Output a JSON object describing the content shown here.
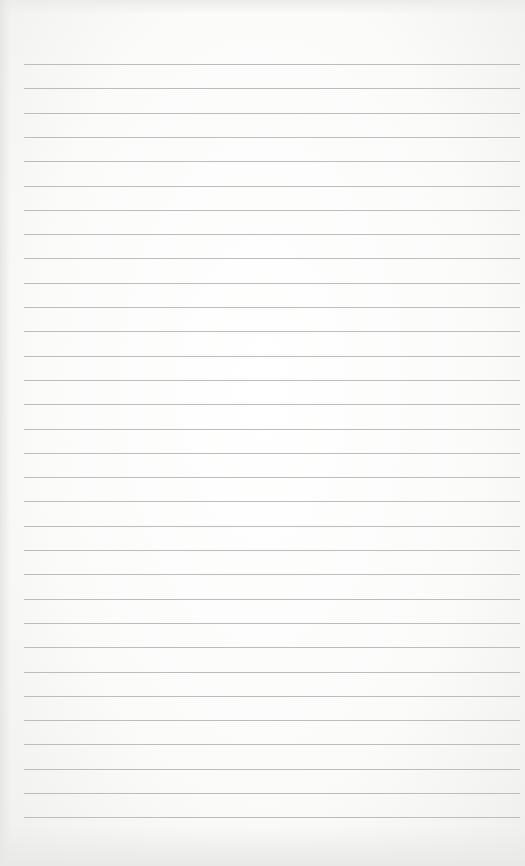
{
  "page": {
    "kind": "lined-paper",
    "text": ""
  },
  "ruling": {
    "line_count": 32,
    "first_line_y": 64,
    "spacing": 24.3,
    "left": 24,
    "width": 496,
    "color": "#bdbdbb"
  },
  "colors": {
    "paper": "#fdfdfc",
    "edge_shadow": "#e6e6e4"
  }
}
